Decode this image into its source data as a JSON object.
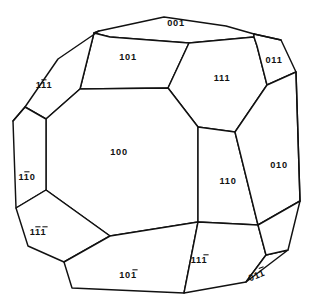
{
  "figure": {
    "kind": "crystal-form-diagram",
    "background_color": "#ffffff",
    "line_color": "#111111",
    "label_color": "#111111"
  },
  "faces": [
    {
      "id": "face-001",
      "label": "001",
      "digits": [
        "0",
        "0",
        "1"
      ],
      "bars": [
        false,
        false,
        false
      ],
      "label_x": 176,
      "label_y": 24,
      "rotation": 0,
      "points": "99,31 164,17 226,26 254,34 254,37 189,43 110,37 94,33"
    },
    {
      "id": "face-101",
      "label": "101",
      "digits": [
        "1",
        "0",
        "1"
      ],
      "bars": [
        false,
        false,
        false
      ],
      "label_x": 128,
      "label_y": 58,
      "rotation": 0,
      "points": "94,33 110,37 189,43 168,88 80,89"
    },
    {
      "id": "face-111-top-right",
      "label": "111",
      "digits": [
        "1",
        "1",
        "1"
      ],
      "bars": [
        false,
        false,
        false
      ],
      "label_x": 222,
      "label_y": 79,
      "rotation": 0,
      "points": "189,43 254,37 257,46 267,85 235,132 198,127 168,88"
    },
    {
      "id": "face-011",
      "label": "011",
      "digits": [
        "0",
        "1",
        "1"
      ],
      "bars": [
        false,
        false,
        false
      ],
      "label_x": 274,
      "label_y": 61,
      "rotation": 0,
      "points": "254,34 254,37 257,46 267,85 296,72 281,40"
    },
    {
      "id": "face-1bar11",
      "label": "1̄11",
      "digits": [
        "1",
        "1",
        "1"
      ],
      "bars": [
        false,
        true,
        false
      ],
      "label_x": 44,
      "label_y": 86,
      "rotation": 0,
      "points": "99,31 94,33 80,89 46,119 25,107 58,59"
    },
    {
      "id": "face-100",
      "label": "100",
      "digits": [
        "1",
        "0",
        "0"
      ],
      "bars": [
        false,
        false,
        false
      ],
      "label_x": 119,
      "label_y": 153,
      "rotation": 0,
      "points": "80,89 168,88 198,127 198,222 110,236 46,190 46,119"
    },
    {
      "id": "face-110",
      "label": "110",
      "digits": [
        "1",
        "1",
        "0"
      ],
      "bars": [
        false,
        false,
        false
      ],
      "label_x": 228,
      "label_y": 182,
      "rotation": 0,
      "points": "198,127 235,132 258,225 198,222"
    },
    {
      "id": "face-010",
      "label": "010",
      "digits": [
        "0",
        "1",
        "0"
      ],
      "bars": [
        false,
        false,
        false
      ],
      "label_x": 279,
      "label_y": 166,
      "rotation": 0,
      "points": "235,132 267,85 296,72 300,201 258,225"
    },
    {
      "id": "face-1bar1bar0",
      "label": "11̄0",
      "digits": [
        "1",
        "1",
        "0"
      ],
      "bars": [
        false,
        true,
        false
      ],
      "label_x": 27,
      "label_y": 178,
      "rotation": 0,
      "points": "25,107 46,119 46,190 16,208 13,121"
    },
    {
      "id": "face-1bar1bar1bar",
      "label": "11̄1̄",
      "digits": [
        "1",
        "1",
        "1"
      ],
      "bars": [
        false,
        true,
        true
      ],
      "label_x": 38,
      "label_y": 233,
      "rotation": 0,
      "points": "16,208 46,190 110,236 64,262 28,246"
    },
    {
      "id": "face-10bar1",
      "label": "101̄",
      "digits": [
        "1",
        "0",
        "1"
      ],
      "bars": [
        false,
        false,
        true
      ],
      "label_x": 128,
      "label_y": 276,
      "rotation": 0,
      "points": "110,236 198,222 184,293 72,288 64,262"
    },
    {
      "id": "face-11bar1",
      "label": "111̄",
      "digits": [
        "1",
        "1",
        "1"
      ],
      "bars": [
        false,
        false,
        true
      ],
      "label_x": 199,
      "label_y": 261,
      "rotation": 0,
      "points": "198,222 258,225 266,255 246,282 184,293"
    },
    {
      "id": "face-01bar1",
      "label": "011̄",
      "digits": [
        "0",
        "1",
        "1"
      ],
      "bars": [
        false,
        false,
        true
      ],
      "label_x": 257,
      "label_y": 276,
      "rotation": -22,
      "points": "266,255 288,250 246,282"
    },
    {
      "id": "face-right-lower-sliver",
      "label": "",
      "digits": [],
      "bars": [],
      "label_x": 0,
      "label_y": 0,
      "rotation": 0,
      "points": "258,225 300,201 288,250 266,255"
    }
  ],
  "extra_edges": [
    "M 25,107 L 13,121",
    "M 281,40 L 254,34",
    "M 296,72 L 300,201"
  ]
}
